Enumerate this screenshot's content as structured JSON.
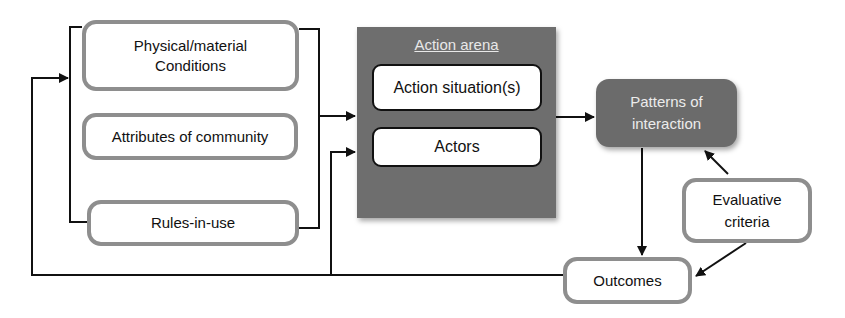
{
  "diagram": {
    "inputs": {
      "physical": "Physical/material\nConditions",
      "physical_line1": "Physical/material",
      "physical_line2": "Conditions",
      "community": "Attributes of community",
      "rules": "Rules-in-use"
    },
    "arena": {
      "title": "Action arena",
      "situation": "Action situation(s)",
      "actors": "Actors"
    },
    "patterns": {
      "line1": "Patterns of",
      "line2": "interaction"
    },
    "evaluative": {
      "line1": "Evaluative",
      "line2": "criteria"
    },
    "outcomes": "Outcomes",
    "colors": {
      "box_border": "#8e8e8e",
      "arena_fill": "#6e6e6e",
      "patterns_fill": "#6b6b6b",
      "line": "#111111"
    }
  }
}
